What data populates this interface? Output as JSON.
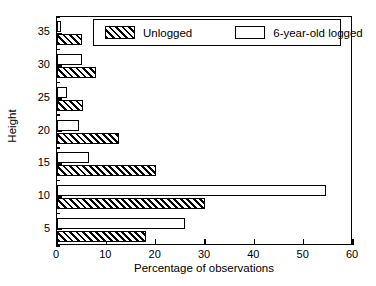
{
  "chart_data": {
    "type": "bar",
    "orientation": "horizontal",
    "title": "",
    "xlabel": "Percentage of observations",
    "ylabel": "Height",
    "xlim": [
      0,
      60
    ],
    "xticks": [
      0,
      10,
      20,
      30,
      40,
      50,
      60
    ],
    "xticklabels": [
      "0",
      "10",
      "20",
      "30",
      "40",
      "50",
      "60"
    ],
    "ylim": [
      2.5,
      37.5
    ],
    "yticks": [
      5,
      10,
      15,
      20,
      25,
      30,
      35
    ],
    "yticklabels": [
      "5",
      "10",
      "15",
      "20",
      "25",
      "30",
      "35"
    ],
    "grid": false,
    "legend_position": "upper center",
    "categories": [
      5,
      10,
      15,
      20,
      25,
      30,
      35
    ],
    "series": [
      {
        "name": "Unlogged",
        "style": "hatched",
        "values": [
          18.0,
          30.0,
          20.0,
          12.5,
          5.2,
          8.0,
          5.0
        ]
      },
      {
        "name": "6-year-old logged",
        "style": "open",
        "values": [
          26.0,
          54.5,
          6.5,
          4.5,
          2.0,
          5.0,
          0.8
        ]
      }
    ]
  },
  "legend": {
    "items": [
      {
        "label": "Unlogged"
      },
      {
        "label": "6-year-old logged"
      }
    ]
  },
  "colors": {
    "axis": "#000000",
    "background": "#ffffff",
    "bar_fill_open": "#ffffff",
    "hatch": "#000000"
  }
}
